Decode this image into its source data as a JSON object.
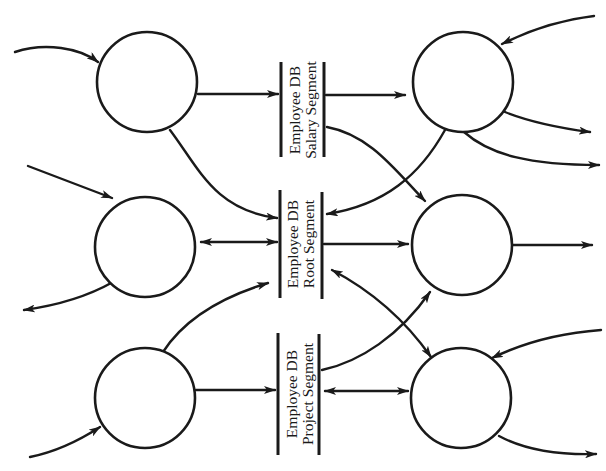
{
  "diagram": {
    "type": "data-flow-diagram",
    "colors": {
      "ink": "#1a1a1a",
      "background": "#ffffff"
    },
    "processes": [
      {
        "id": "left-top",
        "label": ""
      },
      {
        "id": "left-middle",
        "label": ""
      },
      {
        "id": "left-bottom",
        "label": ""
      },
      {
        "id": "right-top",
        "label": ""
      },
      {
        "id": "right-middle",
        "label": ""
      },
      {
        "id": "right-bottom",
        "label": ""
      }
    ],
    "stores": [
      {
        "id": "salary",
        "line1": "Employee DB",
        "line2": "Salary Segment"
      },
      {
        "id": "root",
        "line1": "Employee DB",
        "line2": "Root Segment"
      },
      {
        "id": "project",
        "line1": "Employee DB",
        "line2": "Project Segment"
      }
    ],
    "flows": [
      {
        "from": "external",
        "to": "left-top"
      },
      {
        "from": "left-top",
        "to": "salary"
      },
      {
        "from": "left-top",
        "to": "root"
      },
      {
        "from": "salary",
        "to": "right-top"
      },
      {
        "from": "salary",
        "to": "right-middle"
      },
      {
        "from": "external",
        "to": "right-top"
      },
      {
        "from": "right-top",
        "to": "external"
      },
      {
        "from": "right-top",
        "to": "external"
      },
      {
        "from": "right-top",
        "to": "root"
      },
      {
        "from": "external",
        "to": "left-middle"
      },
      {
        "from": "left-middle",
        "to": "external"
      },
      {
        "from": "left-middle",
        "to": "root",
        "bidirectional": true
      },
      {
        "from": "root",
        "to": "right-middle"
      },
      {
        "from": "right-middle",
        "to": "external"
      },
      {
        "from": "root",
        "to": "right-bottom",
        "bidirectional": true
      },
      {
        "from": "left-bottom",
        "to": "root"
      },
      {
        "from": "external",
        "to": "left-bottom"
      },
      {
        "from": "left-bottom",
        "to": "project"
      },
      {
        "from": "project",
        "to": "right-middle"
      },
      {
        "from": "project",
        "to": "right-bottom",
        "bidirectional": true
      },
      {
        "from": "external",
        "to": "right-bottom"
      },
      {
        "from": "right-bottom",
        "to": "external"
      }
    ]
  }
}
